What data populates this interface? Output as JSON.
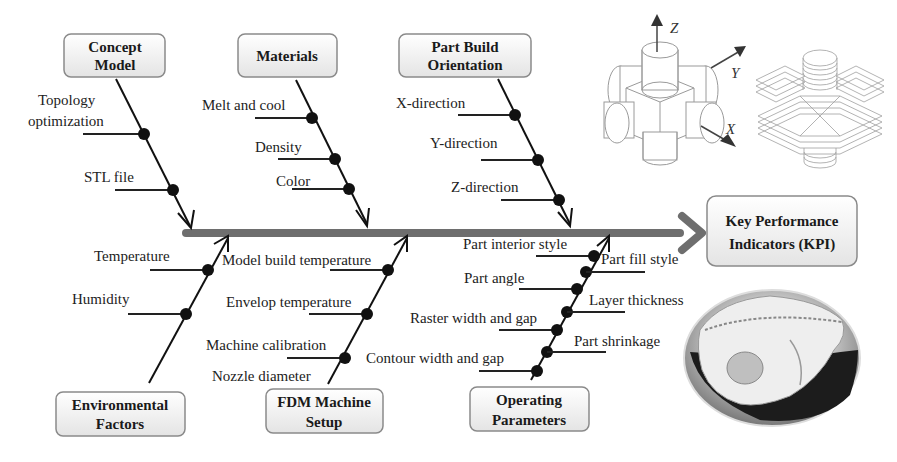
{
  "diagram": {
    "type": "fishbone (Ishikawa) cause-and-effect diagram",
    "effect": {
      "label_line1": "Key Performance",
      "label_line2": "Indicators (KPI)"
    },
    "categories": {
      "concept_model": {
        "title_line1": "Concept",
        "title_line2": "Model",
        "causes": [
          {
            "line1": "Topology",
            "line2": "optimization"
          },
          {
            "line1": "STL file"
          }
        ]
      },
      "materials": {
        "title_line1": "Materials",
        "causes": [
          "Melt and cool",
          "Density",
          "Color"
        ]
      },
      "part_build_orientation": {
        "title_line1": "Part Build",
        "title_line2": "Orientation",
        "causes": [
          "X-direction",
          "Y-direction",
          "Z-direction"
        ]
      },
      "environmental_factors": {
        "title_line1": "Environmental",
        "title_line2": "Factors",
        "causes": [
          "Temperature",
          "Humidity"
        ]
      },
      "fdm_machine_setup": {
        "title_line1": "FDM Machine",
        "title_line2": "Setup",
        "causes": [
          "Model build temperature",
          "Envelop temperature",
          "Machine calibration",
          "Nozzle diameter"
        ]
      },
      "operating_parameters": {
        "title_line1": "Operating",
        "title_line2": "Parameters",
        "causes_left": [
          "Part interior style",
          "Part angle",
          "Raster width and gap",
          "Contour width and gap"
        ],
        "causes_right": [
          "Part fill style",
          "Layer thickness",
          "Part shrinkage"
        ]
      }
    },
    "illustration": {
      "axes": {
        "z": "Z",
        "y": "Y",
        "x": "X"
      },
      "description": "Isometric part with cylindrical bosses in X/Y/Z and its layered sliced version; inset photo of a 3D-printed skull model"
    },
    "colors": {
      "spine": "#6e6e6e",
      "bones": "#111111",
      "box_border": "#8a8a8a",
      "box_fill_top": "#ffffff",
      "box_fill_bottom": "#e6e6e6"
    }
  }
}
